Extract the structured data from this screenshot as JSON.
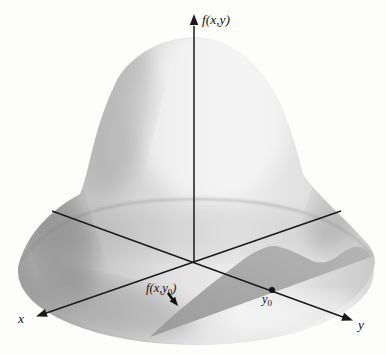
{
  "figure": {
    "type": "3d-surface-diagram",
    "labels": {
      "z_axis": "f(x,y)",
      "x_axis": "x",
      "y_axis": "y",
      "y0_main": "y",
      "y0_sub": "0",
      "slice_prefix": "f(x,y",
      "slice_sub": "0",
      "slice_suffix": ")"
    },
    "colors": {
      "background": "#fdfdfc",
      "surface_light": "#ececec",
      "surface_mid": "#cfcfcf",
      "surface_dark": "#a0a0a0",
      "slice_fill": "#a6a6a6",
      "line": "#1a1a1a",
      "text": "#111111"
    }
  }
}
